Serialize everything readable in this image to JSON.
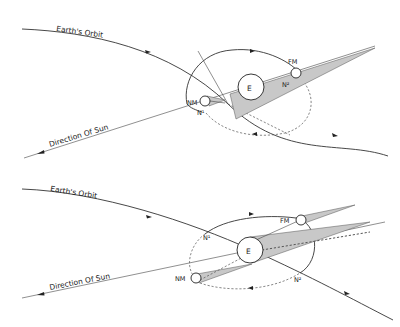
{
  "diagrams": [
    {
      "id": "top",
      "labels": {
        "orbit": "Earth's Orbit",
        "sun": "Direction Of Sun",
        "earth": "E",
        "full_moon": "FM",
        "new_moon": "NM",
        "node1": "N¹",
        "node2": "N²"
      }
    },
    {
      "id": "bottom",
      "labels": {
        "orbit": "Earth's Orbit",
        "sun": "Direction Of Sun",
        "earth": "E",
        "full_moon": "FM",
        "new_moon": "NM",
        "node1": "N¹",
        "node2": "N²"
      }
    }
  ],
  "colors": {
    "line": "#333333",
    "shadow": "#c8c8c8",
    "background": "#ffffff"
  }
}
